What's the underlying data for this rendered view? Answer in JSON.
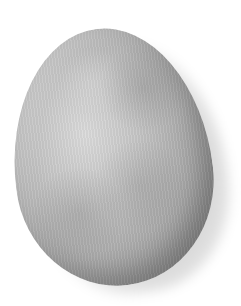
{
  "image": {
    "subject": "egg",
    "description": "A single grey mottled egg on a white background with a soft drop shadow to the lower right",
    "colors": {
      "background": "#ffffff",
      "egg_highlight": "#dcdcdc",
      "egg_mid": "#a9a9a9",
      "egg_shadow": "#7a7a7a"
    }
  }
}
